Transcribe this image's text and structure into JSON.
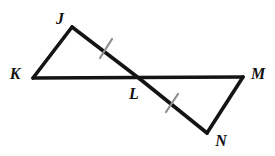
{
  "figure": {
    "name": "two-triangles-vertical-angles",
    "background_color": "#ffffff",
    "stroke_color": "#141414",
    "tick_color": "#8e8e8e",
    "stroke_width": 3.6,
    "tick_width": 2.2
  },
  "points": {
    "J": {
      "label": "J",
      "x": 72,
      "y": 27,
      "label_x": 60,
      "label_y": 19
    },
    "K": {
      "label": "K",
      "x": 33,
      "y": 78,
      "label_x": 15,
      "label_y": 74
    },
    "L": {
      "label": "L",
      "x": 140,
      "y": 79,
      "label_x": 134,
      "label_y": 94
    },
    "M": {
      "label": "M",
      "x": 243,
      "y": 77,
      "label_x": 258,
      "label_y": 74
    },
    "N": {
      "label": "N",
      "x": 207,
      "y": 133,
      "label_x": 221,
      "label_y": 141
    }
  },
  "segments": [
    {
      "name": "segment-K-J",
      "from": "K",
      "to": "J",
      "x1": 33,
      "y1": 78,
      "x2": 72,
      "y2": 27
    },
    {
      "name": "segment-J-L",
      "from": "J",
      "to": "L",
      "x1": 72,
      "y1": 27,
      "x2": 140,
      "y2": 79
    },
    {
      "name": "segment-K-M",
      "from": "K",
      "to": "M",
      "x1": 33,
      "y1": 78,
      "x2": 243,
      "y2": 77
    },
    {
      "name": "segment-L-N",
      "from": "L",
      "to": "N",
      "x1": 140,
      "y1": 79,
      "x2": 207,
      "y2": 133
    },
    {
      "name": "segment-N-M",
      "from": "N",
      "to": "M",
      "x1": 207,
      "y1": 133,
      "x2": 243,
      "y2": 77
    }
  ],
  "tick_marks": [
    {
      "name": "tick-mark-segment-JL",
      "on_segment": "segment-J-L",
      "count": 1,
      "x1": 100,
      "y1": 58,
      "x2": 112,
      "y2": 39
    },
    {
      "name": "tick-mark-segment-LN",
      "on_segment": "segment-L-N",
      "count": 1,
      "x1": 166,
      "y1": 112,
      "x2": 178,
      "y2": 94
    }
  ]
}
